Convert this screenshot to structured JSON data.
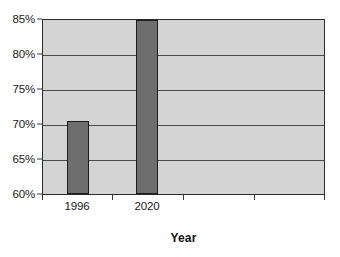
{
  "chart_data": {
    "type": "bar",
    "title": "",
    "subtitle": "",
    "xlabel": "Year",
    "ylabel": "",
    "categories": [
      "1996",
      "2020"
    ],
    "values": [
      70.5,
      85.0
    ],
    "value_unit": "%",
    "ylim": [
      60,
      85
    ],
    "yticks": [
      60,
      65,
      70,
      75,
      80,
      85
    ],
    "ytick_labels": [
      "60%",
      "65%",
      "70%",
      "75%",
      "80%",
      "85%"
    ],
    "xtick_labels": [
      "1996",
      "2020"
    ],
    "grid": "horizontal",
    "legend": "none",
    "series": [
      {
        "name": "",
        "values": [
          70.5,
          85.0
        ]
      }
    ],
    "colors": {
      "bar_fill": "#6e6e6e",
      "bar_outline": "#1c1c1c",
      "plot_background": "#d4d4d4",
      "gridline": "#4a4a4a",
      "axis": "#2b2b2b",
      "text": "#1a1a1a",
      "page_background": "#ffffff"
    },
    "annotations": []
  },
  "axes": {
    "y": {
      "ticks": [
        {
          "label": "85%",
          "value": 85
        },
        {
          "label": "80%",
          "value": 80
        },
        {
          "label": "75%",
          "value": 75
        },
        {
          "label": "70%",
          "value": 70
        },
        {
          "label": "65%",
          "value": 65
        },
        {
          "label": "60%",
          "value": 60
        }
      ]
    },
    "x": {
      "title": "Year",
      "ticks": [
        {
          "label": "1996",
          "value": 70.5
        },
        {
          "label": "2020",
          "value": 85.0
        }
      ]
    }
  }
}
